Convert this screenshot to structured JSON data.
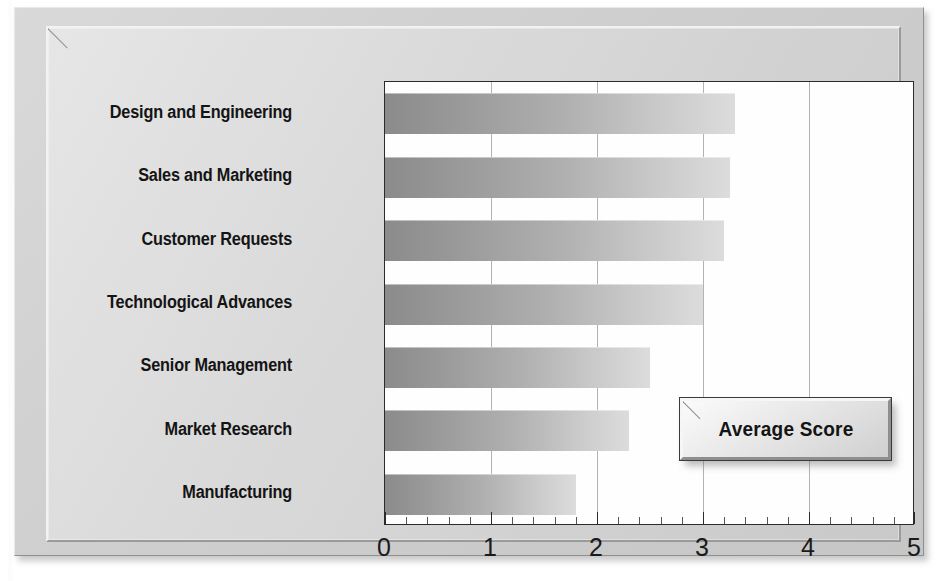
{
  "chart_data": {
    "type": "bar",
    "orientation": "horizontal",
    "title": "",
    "xlabel": "",
    "ylabel": "",
    "xlim": [
      0,
      5
    ],
    "grid": true,
    "legend_position": "inside-right",
    "categories": [
      "Design and Engineering",
      "Sales and Marketing",
      "Customer Requests",
      "Technological Advances",
      "Senior Management",
      "Market Research",
      "Manufacturing"
    ],
    "series": [
      {
        "name": "Average Score",
        "values": [
          3.3,
          3.25,
          3.2,
          3.0,
          2.5,
          2.3,
          1.8
        ]
      }
    ],
    "xticks": [
      {
        "value": 0,
        "label": "0"
      },
      {
        "value": 1,
        "label": "1"
      },
      {
        "value": 2,
        "label": "2"
      },
      {
        "value": 3,
        "label": "3"
      },
      {
        "value": 4,
        "label": "4"
      },
      {
        "value": 5,
        "label": "5"
      }
    ],
    "minor_tick_step": 0.2,
    "colors": {
      "bar_start": "#8b8b8b",
      "bar_end": "#dcdcdc",
      "plot_background": "#fefefe",
      "panel_background": "#d9d9d9",
      "gridline": "#b3b3b3",
      "axis": "#2b2b2b",
      "text": "#141414"
    }
  },
  "legend": {
    "label": "Average Score"
  }
}
